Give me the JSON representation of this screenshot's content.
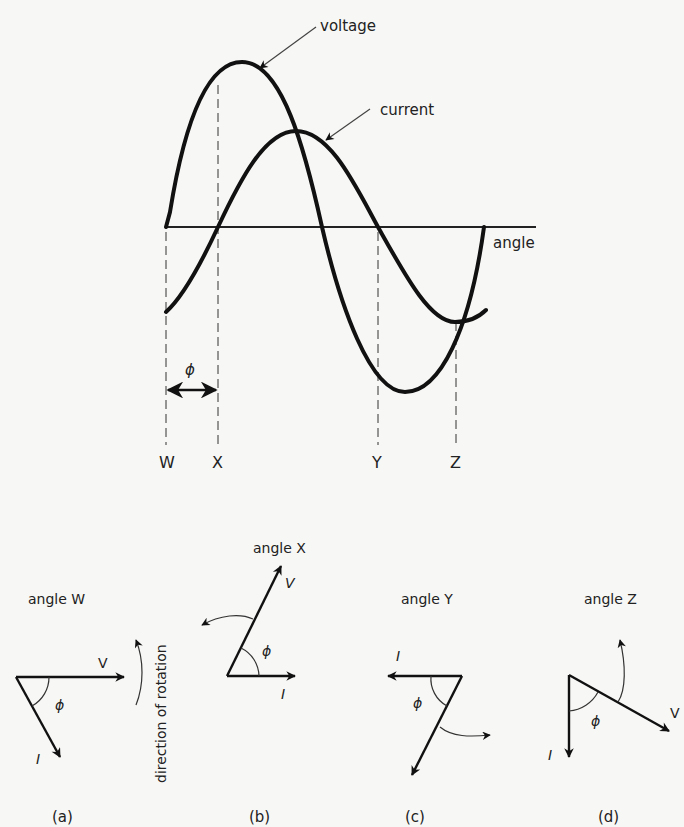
{
  "waveform": {
    "axis_label": "angle",
    "curve_labels": {
      "voltage": "voltage",
      "current": "current"
    },
    "phase_symbol": "ϕ",
    "markers": [
      {
        "id": "W",
        "label": "W"
      },
      {
        "id": "X",
        "label": "X"
      },
      {
        "id": "Y",
        "label": "Y"
      },
      {
        "id": "Z",
        "label": "Z"
      }
    ]
  },
  "phasors": [
    {
      "caption": "(a)",
      "title": "angle W",
      "v_label": "V",
      "i_label": "I",
      "phi": "ϕ"
    },
    {
      "caption": "(b)",
      "title": "angle X",
      "v_label": "V",
      "i_label": "I",
      "phi": "ϕ"
    },
    {
      "caption": "(c)",
      "title": "angle Y",
      "v_label": "V",
      "i_label": "I",
      "phi": "ϕ"
    },
    {
      "caption": "(d)",
      "title": "angle Z",
      "v_label": "V",
      "i_label": "I",
      "phi": "ϕ"
    }
  ],
  "rotation_label": "direction of rotation"
}
